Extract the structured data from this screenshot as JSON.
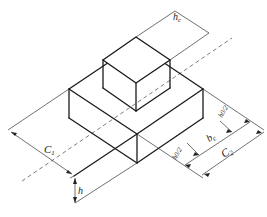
{
  "figure": {
    "colors": {
      "line": "#1a1a1a",
      "dimension": "#333333",
      "background": "#ffffff"
    }
  },
  "labels": {
    "hc": {
      "main": "h",
      "sub": "c"
    },
    "c1": {
      "main": "C",
      "sub": "1"
    },
    "h": {
      "main": "h"
    },
    "bc": {
      "main": "b",
      "sub": "c"
    },
    "c2": {
      "main": "C",
      "sub": "2"
    },
    "h0_half_left": {
      "num": "h0",
      "den": "2"
    },
    "h0_half_right": {
      "num": "h0",
      "den": "2"
    }
  }
}
